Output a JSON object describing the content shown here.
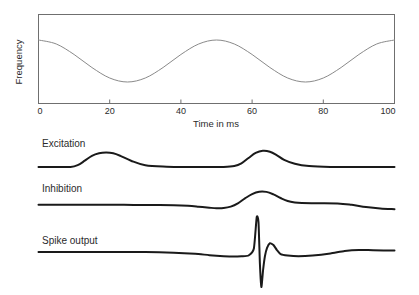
{
  "figure": {
    "background": "#ffffff",
    "stimulus_color": "#8a8a8a",
    "trace_color": "#1a1a1a",
    "frame_color": "#6f6f6f"
  },
  "chart_data": {
    "type": "line",
    "title": "",
    "subtitle": "",
    "xlabel": "Time in ms",
    "ylabel": "Frequency",
    "xlim": [
      0,
      100
    ],
    "xticks": [
      0,
      20,
      40,
      60,
      80,
      100
    ],
    "xticklabels": [
      "0",
      "20",
      "40",
      "60",
      "80",
      "100"
    ],
    "ylim": [
      0,
      1
    ],
    "yticks": [],
    "yticklabels": [],
    "grid": false,
    "legend": "none",
    "panels": [
      {
        "name": "stimulus",
        "label": "",
        "ylabel": "Frequency",
        "framed": true,
        "series": [
          {
            "name": "frequency-modulation",
            "description": "Sinusoidal frequency modulation, cosine phase: peak at 0 ms, trough at 25 ms, peak at 50 ms, trough at 75 ms, peak at 100 ms",
            "waveform": "cosine",
            "cycles": 2,
            "phase_deg": 0,
            "amplitude": 0.5,
            "offset": 0.5,
            "x": [
              0,
              5,
              10,
              15,
              20,
              25,
              30,
              35,
              40,
              45,
              50,
              55,
              60,
              65,
              70,
              75,
              80,
              85,
              90,
              95,
              100
            ],
            "y": [
              1.0,
              0.905,
              0.655,
              0.345,
              0.095,
              0.0,
              0.095,
              0.345,
              0.655,
              0.905,
              1.0,
              0.905,
              0.655,
              0.345,
              0.095,
              0.0,
              0.095,
              0.345,
              0.655,
              0.905,
              1.0
            ]
          }
        ]
      },
      {
        "name": "excitation",
        "label": "Excitation",
        "framed": false,
        "series": [
          {
            "name": "excitation-trace",
            "description": "Two depolarizing humps, one near 12 ms and a larger one near 62 ms",
            "x": [
              0,
              5,
              9,
              11,
              13,
              15,
              17,
              19,
              21,
              23,
              26,
              30,
              36,
              42,
              48,
              52,
              55,
              57,
              59,
              61,
              63,
              65,
              67,
              69,
              72,
              76,
              82,
              90,
              100
            ],
            "y": [
              0.0,
              0.0,
              0.0,
              0.1,
              0.35,
              0.62,
              0.76,
              0.8,
              0.76,
              0.62,
              0.35,
              0.1,
              0.02,
              0.0,
              0.0,
              0.0,
              0.05,
              0.2,
              0.5,
              0.78,
              0.9,
              0.85,
              0.65,
              0.4,
              0.18,
              0.05,
              0.0,
              0.0,
              0.0
            ]
          }
        ]
      },
      {
        "name": "inhibition",
        "label": "Inhibition",
        "framed": false,
        "series": [
          {
            "name": "inhibition-trace",
            "description": "Flat baseline, slow decline after 42 ms to a trough near 52 ms, broad peak near 62 ms, then gradual decline to the end",
            "x": [
              0,
              8,
              16,
              24,
              32,
              38,
              42,
              45,
              48,
              50,
              52,
              54,
              56,
              58,
              60,
              62,
              64,
              66,
              68,
              70,
              72,
              74,
              78,
              84,
              88,
              92,
              96,
              100
            ],
            "y": [
              0.12,
              0.12,
              0.12,
              0.12,
              0.11,
              0.1,
              0.07,
              0.02,
              -0.04,
              -0.07,
              -0.06,
              0.02,
              0.2,
              0.48,
              0.72,
              0.85,
              0.84,
              0.7,
              0.5,
              0.33,
              0.25,
              0.22,
              0.21,
              0.2,
              0.12,
              0.0,
              -0.08,
              -0.12
            ]
          }
        ]
      },
      {
        "name": "spike_output",
        "label": "Spike output",
        "framed": false,
        "series": [
          {
            "name": "spike-output-trace",
            "description": "Flat baseline with a single sharp biphasic action potential near 62 ms: tall narrow upstroke, deep undershoot, then a small rebound bump",
            "x": [
              0,
              10,
              20,
              30,
              38,
              44,
              48,
              52,
              55,
              57,
              59,
              60.5,
              61.3,
              61.8,
              62.2,
              62.6,
              63.1,
              63.6,
              64.2,
              65,
              66,
              67,
              68,
              70,
              73,
              77,
              82,
              86,
              90,
              94,
              100
            ],
            "y": [
              0.0,
              0.0,
              0.0,
              0.0,
              -0.02,
              -0.05,
              -0.09,
              -0.12,
              -0.13,
              -0.12,
              -0.1,
              0.1,
              1.0,
              0.85,
              -0.35,
              -1.0,
              -0.5,
              -0.12,
              0.12,
              0.25,
              0.2,
              0.05,
              -0.06,
              -0.1,
              -0.12,
              -0.1,
              -0.04,
              0.03,
              0.06,
              0.05,
              0.04
            ]
          }
        ]
      }
    ]
  }
}
